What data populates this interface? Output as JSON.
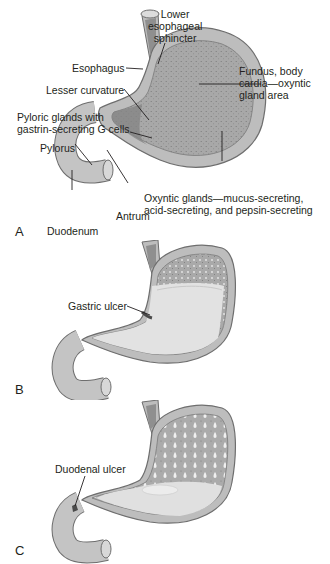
{
  "figure": {
    "panels": [
      {
        "letter": "A",
        "labels": {
          "lower_esophageal_sphincter": [
            "Lower",
            "esophageal",
            "sphincter"
          ],
          "esophagus": "Esophagus",
          "lesser_curvature": "Lesser curvature",
          "pyloric_glands": [
            "Pyloric glands with",
            "gastrin-secreting G cells"
          ],
          "pylorus": "Pylorus",
          "fundus": [
            "Fundus, body",
            "cardia—oxyntic",
            "gland area"
          ],
          "oxyntic_glands": [
            "Oxyntic glands—mucus-secreting,",
            "acid-secreting, and pepsin-secreting"
          ],
          "antrum": "Antrum",
          "duodenum": "Duodenum"
        }
      },
      {
        "letter": "B",
        "labels": {
          "gastric_ulcer": "Gastric ulcer"
        }
      },
      {
        "letter": "C",
        "labels": {
          "duodenal_ulcer": "Duodenal ulcer"
        }
      }
    ],
    "colors": {
      "outer_wall": "#bdbdbd",
      "inner_mucosa_dotted": "#a9a9a9",
      "antrum_dark": "#8c8c8c",
      "lumen_fluid": "#e3e3e3",
      "outline": "#6e6e6e",
      "leader_line": "#231f20"
    }
  }
}
